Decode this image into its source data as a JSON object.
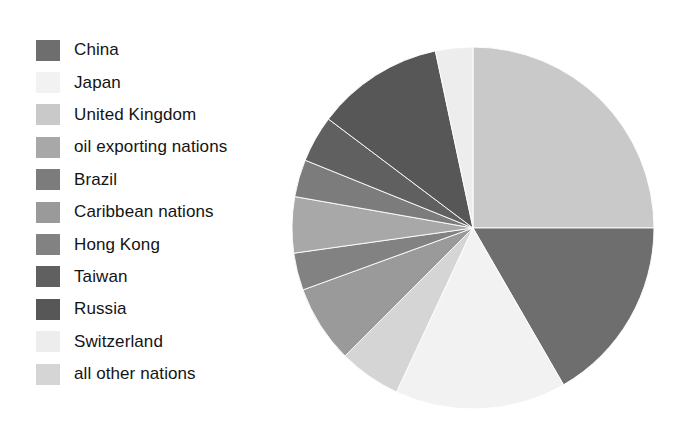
{
  "figure": {
    "background_color": "#ffffff",
    "type": "pie-chart-with-legend"
  },
  "legend": {
    "position": "left",
    "items": [
      {
        "label": "China",
        "color": "#6e6e6e"
      },
      {
        "label": "Japan",
        "color": "#f2f2f2"
      },
      {
        "label": "United Kingdom",
        "color": "#c9c9c9"
      },
      {
        "label": "oil exporting nations",
        "color": "#a8a8a8"
      },
      {
        "label": "Brazil",
        "color": "#7c7c7c"
      },
      {
        "label": "Caribbean nations",
        "color": "#9a9a9a"
      },
      {
        "label": "Hong Kong",
        "color": "#828282"
      },
      {
        "label": "Taiwan",
        "color": "#606060"
      },
      {
        "label": "Russia",
        "color": "#575757"
      },
      {
        "label": "Switzerland",
        "color": "#ededed"
      },
      {
        "label": "all other nations",
        "color": "#d5d5d5"
      }
    ]
  },
  "chart_data": {
    "type": "pie",
    "title": "",
    "start_angle_deg": 0,
    "direction": "clockwise",
    "center": {
      "x": 182,
      "y": 181
    },
    "radius": 181,
    "categories": [
      "United Kingdom",
      "China",
      "Japan",
      "all other nations",
      "Caribbean nations",
      "Hong Kong",
      "oil exporting nations",
      "Brazil",
      "Taiwan",
      "Russia",
      "Switzerland"
    ],
    "values": [
      25.0,
      16.7,
      15.3,
      5.6,
      6.9,
      3.3,
      5.0,
      3.3,
      4.2,
      11.4,
      3.3
    ],
    "units": "percent",
    "colors": [
      "#c9c9c9",
      "#6e6e6e",
      "#f2f2f2",
      "#d5d5d5",
      "#9a9a9a",
      "#828282",
      "#a8a8a8",
      "#7c7c7c",
      "#606060",
      "#575757",
      "#ededed"
    ],
    "slice_angles_deg": [
      {
        "name": "United Kingdom",
        "start": 0,
        "end": 90
      },
      {
        "name": "China",
        "start": 90,
        "end": 150
      },
      {
        "name": "Japan",
        "start": 150,
        "end": 205
      },
      {
        "name": "all other nations",
        "start": 205,
        "end": 225
      },
      {
        "name": "Caribbean nations",
        "start": 225,
        "end": 250
      },
      {
        "name": "Hong Kong",
        "start": 250,
        "end": 262
      },
      {
        "name": "oil exporting nations",
        "start": 262,
        "end": 280
      },
      {
        "name": "Brazil",
        "start": 280,
        "end": 292
      },
      {
        "name": "Taiwan",
        "start": 292,
        "end": 307
      },
      {
        "name": "Russia",
        "start": 307,
        "end": 348
      },
      {
        "name": "Switzerland",
        "start": 348,
        "end": 360
      }
    ],
    "legend_position": "left",
    "grid": false,
    "xlabel": "",
    "ylabel": ""
  }
}
